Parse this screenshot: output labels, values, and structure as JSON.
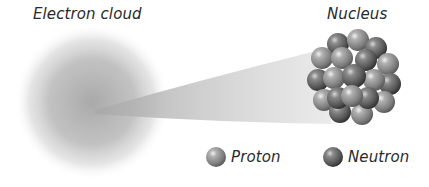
{
  "diagram": {
    "labels": {
      "electron_cloud": "Electron cloud",
      "nucleus": "Nucleus"
    },
    "legend": [
      {
        "label": "Proton",
        "icon": "proton-sphere-icon",
        "color": "#8a8a8a"
      },
      {
        "label": "Neutron",
        "icon": "neutron-sphere-icon",
        "color": "#5e5e5e"
      }
    ],
    "colors": {
      "cloud": "#9a9a9a",
      "wedge": "#c8c8c8",
      "proton": "#8a8a8a",
      "neutron": "#5e5e5e",
      "text": "#2a2a2a"
    }
  }
}
